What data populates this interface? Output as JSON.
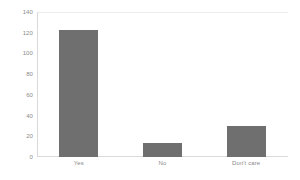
{
  "chart_data": {
    "type": "bar",
    "title": "",
    "subtitle": "",
    "xlabel": "",
    "ylabel": "",
    "categories": [
      "Yes",
      "No",
      "Don't care"
    ],
    "values": [
      123,
      14,
      30
    ],
    "series": [
      {
        "name": "Responses",
        "values": [
          123,
          14,
          30
        ]
      }
    ],
    "ylim": [
      0,
      140
    ],
    "ytick_labels": [
      "140",
      "120",
      "100",
      "80",
      "60",
      "40",
      "20",
      "0"
    ],
    "ytick_values": [
      140,
      120,
      100,
      80,
      60,
      40,
      20,
      0
    ],
    "grid": false,
    "legend": false,
    "legend_position": "none",
    "bar_color": "#6f6f6f",
    "axis_color": "#d9d9d9",
    "tick_label_color": "#8a8a8a",
    "background_color": "#ffffff"
  }
}
